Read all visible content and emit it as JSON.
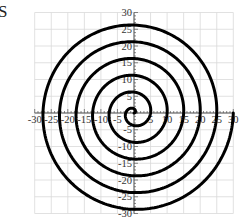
{
  "partial_text": "S",
  "chart_data": {
    "type": "line",
    "title": "",
    "xlabel": "",
    "ylabel": "",
    "xlim": [
      -30,
      30
    ],
    "ylim": [
      -30,
      30
    ],
    "grid": true,
    "grid_step": 5,
    "x_ticks": [
      -30,
      -25,
      -20,
      -15,
      -10,
      -5,
      5,
      10,
      15,
      20,
      25,
      30
    ],
    "x_tick_labels": [
      "-30",
      "-25",
      "-20",
      "-15",
      "-10",
      "-5",
      "5",
      "10",
      "15",
      "20",
      "25",
      "30"
    ],
    "y_ticks": [
      30,
      25,
      20,
      15,
      10,
      5,
      -5,
      -10,
      -15,
      -20,
      -25,
      -30
    ],
    "y_tick_labels": [
      "30",
      "25",
      "20",
      "15",
      "10",
      "5",
      "-5",
      "-10",
      "-15",
      "-20",
      "-25",
      "-30"
    ],
    "series": [
      {
        "name": "spiral",
        "equation": "r = 5θ/(2π)",
        "theta_start": 0,
        "theta_end_turns": 6,
        "r_end": 30,
        "color": "#000000",
        "line_width": 3
      }
    ],
    "colors": {
      "grid": "#d9d9d9",
      "axis": "#555555",
      "curve": "#000000"
    }
  }
}
